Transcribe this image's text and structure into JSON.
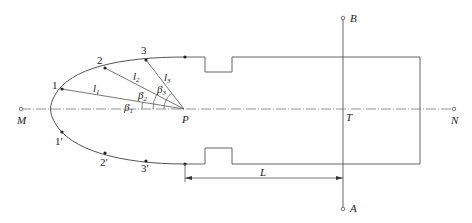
{
  "diagram": {
    "axis_labels": {
      "M": "M",
      "N": "N",
      "P": "P",
      "T": "T",
      "A": "A",
      "B": "B"
    },
    "points_upper": [
      "1",
      "2",
      "3"
    ],
    "points_lower": [
      "1′",
      "2′",
      "3′"
    ],
    "lengths": {
      "l1": "l",
      "l1_sub": "1",
      "l2": "l",
      "l2_sub": "2",
      "l3": "l",
      "l3_sub": "3"
    },
    "angles": {
      "b1": "β",
      "b1_sub": "1",
      "b2": "β",
      "b2_sub": "2",
      "b3": "β",
      "b3_sub": "3"
    },
    "dimension": {
      "L": "L"
    },
    "colors": {
      "line": "#555555",
      "text": "#222222"
    }
  }
}
